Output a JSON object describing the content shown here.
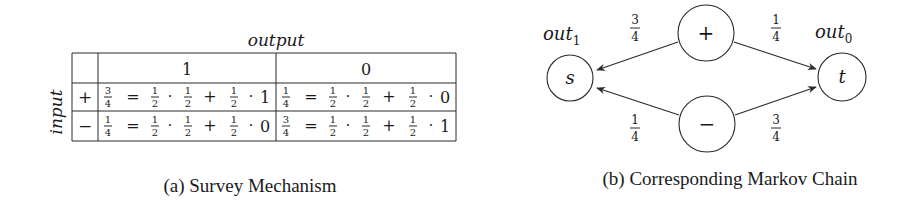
{
  "figure_a": {
    "caption": "(a) Survey Mechanism",
    "column_axis_label": "output",
    "row_axis_label": "input",
    "column_headers": [
      "1",
      "0"
    ],
    "rows": [
      {
        "input": "+",
        "cells": [
          {
            "lhs": {
              "num": "3",
              "den": "4"
            },
            "terms": [
              {
                "num": "1",
                "den": "2"
              },
              {
                "num": "1",
                "den": "2"
              },
              {
                "num": "1",
                "den": "2"
              }
            ],
            "last": "1"
          },
          {
            "lhs": {
              "num": "1",
              "den": "4"
            },
            "terms": [
              {
                "num": "1",
                "den": "2"
              },
              {
                "num": "1",
                "den": "2"
              },
              {
                "num": "1",
                "den": "2"
              }
            ],
            "last": "0"
          }
        ]
      },
      {
        "input": "−",
        "cells": [
          {
            "lhs": {
              "num": "1",
              "den": "4"
            },
            "terms": [
              {
                "num": "1",
                "den": "2"
              },
              {
                "num": "1",
                "den": "2"
              },
              {
                "num": "1",
                "den": "2"
              }
            ],
            "last": "0"
          },
          {
            "lhs": {
              "num": "3",
              "den": "4"
            },
            "terms": [
              {
                "num": "1",
                "den": "2"
              },
              {
                "num": "1",
                "den": "2"
              },
              {
                "num": "1",
                "den": "2"
              }
            ],
            "last": "1"
          }
        ]
      }
    ],
    "symbols": {
      "eq": "=",
      "dot": "·",
      "plus": "+"
    }
  },
  "figure_b": {
    "caption": "(b) Corresponding Markov Chain",
    "nodes": {
      "plus": {
        "label": "+"
      },
      "minus": {
        "label": "−"
      },
      "s": {
        "label": "s",
        "out_label": "out",
        "out_sub": "1"
      },
      "t": {
        "label": "t",
        "out_label": "out",
        "out_sub": "0"
      }
    },
    "edges": [
      {
        "from": "+",
        "to": "s",
        "num": "3",
        "den": "4"
      },
      {
        "from": "+",
        "to": "t",
        "num": "1",
        "den": "4"
      },
      {
        "from": "−",
        "to": "s",
        "num": "1",
        "den": "4"
      },
      {
        "from": "−",
        "to": "t",
        "num": "3",
        "den": "4"
      }
    ]
  }
}
